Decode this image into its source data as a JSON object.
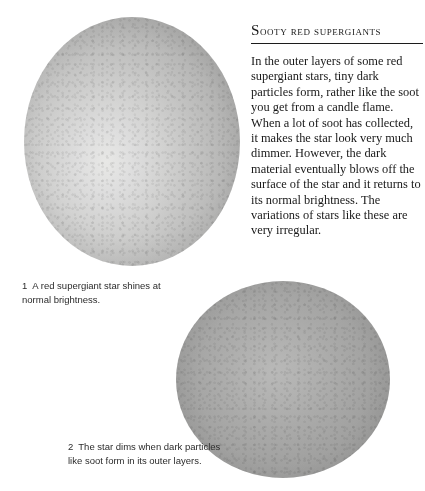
{
  "page": {
    "running_head": "The Stars",
    "background_color": "#ffffff"
  },
  "article": {
    "heading": "Sooty red supergiants",
    "body": "In the outer layers of some red supergiant stars, tiny dark particles form, rather like the soot you get from a candle flame. When a lot of soot has collected, it makes the star look very much dimmer. However, the dark material eventually blows off the surface of the star and it returns to its normal brightness. The variations of stars like these are very irregular."
  },
  "figures": [
    {
      "id": "star-bright",
      "name": "red-supergiant-normal-brightness",
      "number": "1",
      "caption": "A red supergiant star shines at normal brightness.",
      "center_color": "#e8e8e6",
      "edge_color": "#9a9a99"
    },
    {
      "id": "star-dim",
      "name": "red-supergiant-dimmed",
      "number": "2",
      "caption": "The star dims when dark particles like soot form in its outer layers.",
      "center_color": "#b9b9b8",
      "edge_color": "#8d8d8c"
    }
  ]
}
